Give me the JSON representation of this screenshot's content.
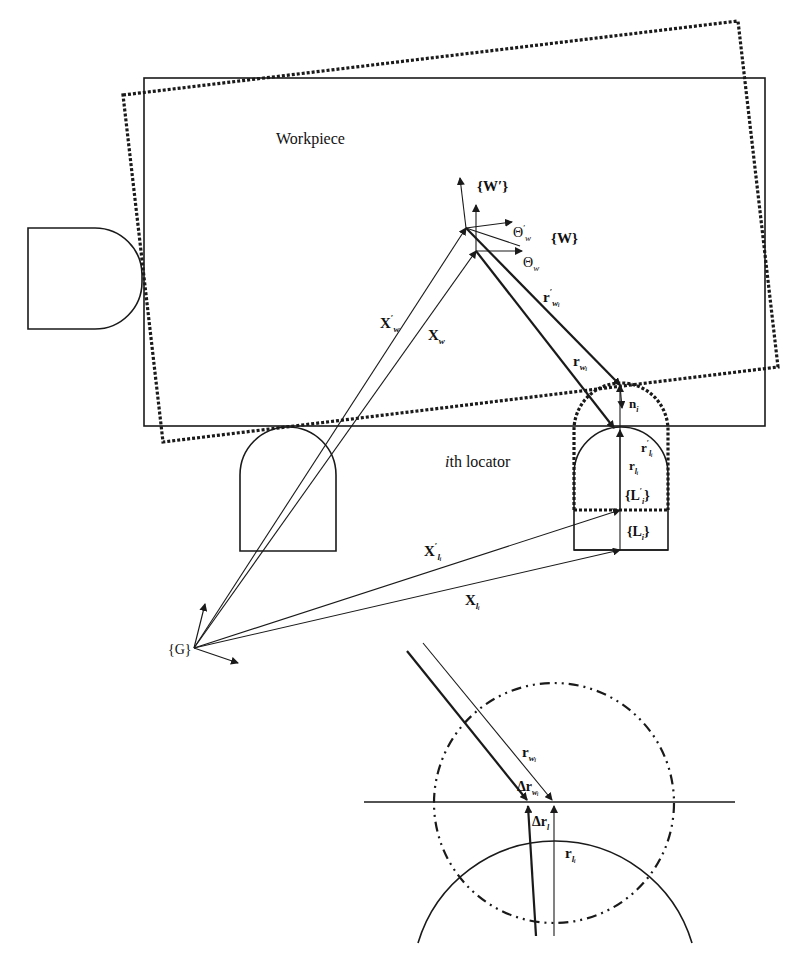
{
  "figure": {
    "labels": {
      "workpiece": "Workpiece",
      "locator": "th locator",
      "locator_index": "i",
      "frame_G": "{G}",
      "frame_W": "{W}",
      "frame_W_prime": "{W′}",
      "frame_L": "{L",
      "frame_L_sub": "i",
      "frame_L_close": "}",
      "frame_L_prime": "{L′",
      "theta_w": "Θ",
      "theta_sub": "w",
      "theta_prime": "′",
      "X_w": "X",
      "X_w_sub": "w",
      "X_w_prime": "X′",
      "X_l": "X",
      "X_l_sub": "l",
      "X_l_subsub": "i",
      "X_l_prime": "X′",
      "r_w": "r",
      "r_w_sub": "w",
      "r_w_subsub": "i",
      "r_w_prime": "r′",
      "r_l": "r",
      "r_l_sub": "l",
      "r_l_subsub": "i",
      "r_l_prime": "r′",
      "n": "n",
      "n_sub": "i",
      "delta_r_w": "Δr",
      "delta_r_l": "Δr",
      "delta_r_l_sub": "l"
    }
  }
}
